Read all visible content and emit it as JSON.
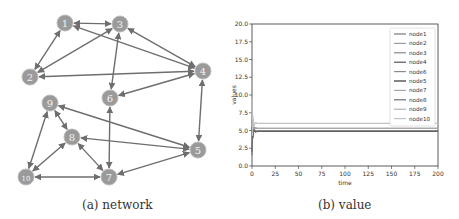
{
  "figure": {
    "captions": {
      "a": "(a) network",
      "b": "(b) value"
    },
    "colors": {
      "node_fill": "#9a9a9a",
      "node_stroke": "#bdbdbd",
      "edge": "#6e6e6e",
      "node_text": "#f2f2f2"
    }
  },
  "network": {
    "nodes": [
      {
        "id": "1",
        "x": 65,
        "y": 23
      },
      {
        "id": "3",
        "x": 120,
        "y": 24
      },
      {
        "id": "2",
        "x": 30,
        "y": 77
      },
      {
        "id": "4",
        "x": 203,
        "y": 71
      },
      {
        "id": "6",
        "x": 110,
        "y": 98
      },
      {
        "id": "9",
        "x": 50,
        "y": 103
      },
      {
        "id": "8",
        "x": 72,
        "y": 137
      },
      {
        "id": "5",
        "x": 198,
        "y": 150
      },
      {
        "id": "10",
        "x": 26,
        "y": 177
      },
      {
        "id": "7",
        "x": 109,
        "y": 177
      }
    ],
    "edges": [
      [
        "1",
        "3"
      ],
      [
        "1",
        "2"
      ],
      [
        "1",
        "4"
      ],
      [
        "3",
        "2"
      ],
      [
        "3",
        "4"
      ],
      [
        "3",
        "6"
      ],
      [
        "2",
        "4"
      ],
      [
        "4",
        "6"
      ],
      [
        "4",
        "5"
      ],
      [
        "9",
        "5"
      ],
      [
        "9",
        "8"
      ],
      [
        "9",
        "10"
      ],
      [
        "8",
        "5"
      ],
      [
        "8",
        "10"
      ],
      [
        "8",
        "7"
      ],
      [
        "6",
        "7"
      ],
      [
        "10",
        "7"
      ],
      [
        "7",
        "5"
      ]
    ]
  },
  "chart_data": {
    "type": "line",
    "title": "",
    "xlabel": "time",
    "ylabel": "values",
    "xlim": [
      0,
      200
    ],
    "ylim": [
      0,
      20
    ],
    "xticks": [
      0,
      25,
      50,
      75,
      100,
      125,
      150,
      175,
      200
    ],
    "yticks": [
      0.0,
      2.5,
      5.0,
      7.5,
      10.0,
      12.5,
      15.0,
      17.5,
      20.0
    ],
    "ytick_labels": [
      "0.0",
      "2.5",
      "5.0",
      "7.5",
      "10.0",
      "12.5",
      "15.0",
      "17.5",
      "20.0"
    ],
    "grid": false,
    "legend_position": "upper right",
    "series": [
      {
        "name": "node1",
        "color": "#7a7a7a",
        "steady": 5.3,
        "initial": 6.5
      },
      {
        "name": "node2",
        "color": "#9a9a9a",
        "steady": 4.9,
        "initial": 3.5
      },
      {
        "name": "node3",
        "color": "#8a8a8a",
        "steady": 5.3,
        "initial": 7.0
      },
      {
        "name": "node4",
        "color": "#555555",
        "steady": 4.9,
        "initial": 2.0
      },
      {
        "name": "node6",
        "color": "#8c8c8c",
        "steady": 5.3,
        "initial": 4.0
      },
      {
        "name": "node5",
        "color": "#333333",
        "steady": 4.9,
        "initial": 5.5
      },
      {
        "name": "node7",
        "color": "#a8a8a8",
        "steady": 6.0,
        "initial": 8.0
      },
      {
        "name": "node8",
        "color": "#6e6e6e",
        "steady": 4.9,
        "initial": 1.5
      },
      {
        "name": "node9",
        "color": "#b0b0b0",
        "steady": 5.3,
        "initial": 6.0
      },
      {
        "name": "node10",
        "color": "#c4c4c4",
        "steady": 6.0,
        "initial": 9.5
      }
    ],
    "note": "All node values converge quickly within first ~5 time units to steady levels of approximately 6.0, 5.3 and 4.9."
  }
}
